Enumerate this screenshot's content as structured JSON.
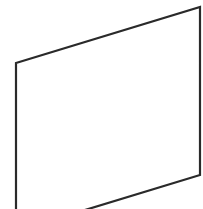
{
  "diagram": {
    "shape": "parallelogram",
    "stroke_color": "#2a2a2a",
    "fill_color": "#ffffff",
    "points": "16,63 200,7 200,175 16,231"
  }
}
